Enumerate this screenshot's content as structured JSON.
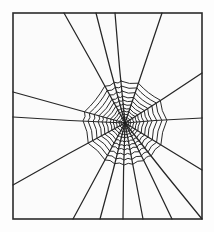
{
  "figure": {
    "caption": "",
    "background_color": "#fbfbfb",
    "line_color": "#262626",
    "frame_color": "#2b2b2b",
    "canvas": {
      "width": 214,
      "height": 232
    }
  },
  "frame": {
    "name": "border-rectangle",
    "x": 13,
    "y": 13,
    "width": 189,
    "height": 206,
    "stroke_width": 1.6
  },
  "web": {
    "hub": {
      "x": 125,
      "y": 123
    },
    "radial_count": 16,
    "spiral_turns": 11,
    "spiral_outer_radius": 42,
    "spiral_inner_radius": 3,
    "radials": [
      {
        "id": "radial-n",
        "label": "north",
        "end_x": 115,
        "end_y": 13
      },
      {
        "id": "radial-nne",
        "label": "north-northeast",
        "end_x": 162,
        "end_y": 13
      },
      {
        "id": "radial-ne",
        "label": "northeast",
        "end_x": 202,
        "end_y": 73
      },
      {
        "id": "radial-ene",
        "label": "east-northeast",
        "end_x": 202,
        "end_y": 118
      },
      {
        "id": "radial-ese",
        "label": "east-southeast",
        "end_x": 202,
        "end_y": 170
      },
      {
        "id": "radial-se",
        "label": "southeast",
        "end_x": 202,
        "end_y": 219
      },
      {
        "id": "radial-sse",
        "label": "south-southeast",
        "end_x": 172,
        "end_y": 219
      },
      {
        "id": "radial-s2",
        "label": "south-east-lower",
        "end_x": 143,
        "end_y": 219
      },
      {
        "id": "radial-s",
        "label": "south",
        "end_x": 123,
        "end_y": 219
      },
      {
        "id": "radial-ssw",
        "label": "south-southwest",
        "end_x": 100,
        "end_y": 219
      },
      {
        "id": "radial-sw2",
        "label": "southwest-lower",
        "end_x": 73,
        "end_y": 219
      },
      {
        "id": "radial-sw",
        "label": "southwest",
        "end_x": 13,
        "end_y": 185
      },
      {
        "id": "radial-wsw",
        "label": "west-southwest",
        "end_x": 13,
        "end_y": 117
      },
      {
        "id": "radial-w",
        "label": "west",
        "end_x": 13,
        "end_y": 92
      },
      {
        "id": "radial-nw",
        "label": "northwest",
        "end_x": 64,
        "end_y": 13
      },
      {
        "id": "radial-nnw",
        "label": "north-northwest",
        "end_x": 96,
        "end_y": 13
      }
    ],
    "spiral_rings": [
      {
        "index": 1,
        "radius": 42
      },
      {
        "index": 2,
        "radius": 37
      },
      {
        "index": 3,
        "radius": 32
      },
      {
        "index": 4,
        "radius": 27
      },
      {
        "index": 5,
        "radius": 23
      },
      {
        "index": 6,
        "radius": 19
      },
      {
        "index": 7,
        "radius": 15
      },
      {
        "index": 8,
        "radius": 12
      },
      {
        "index": 9,
        "radius": 9
      },
      {
        "index": 10,
        "radius": 6
      },
      {
        "index": 11,
        "radius": 4
      }
    ]
  }
}
